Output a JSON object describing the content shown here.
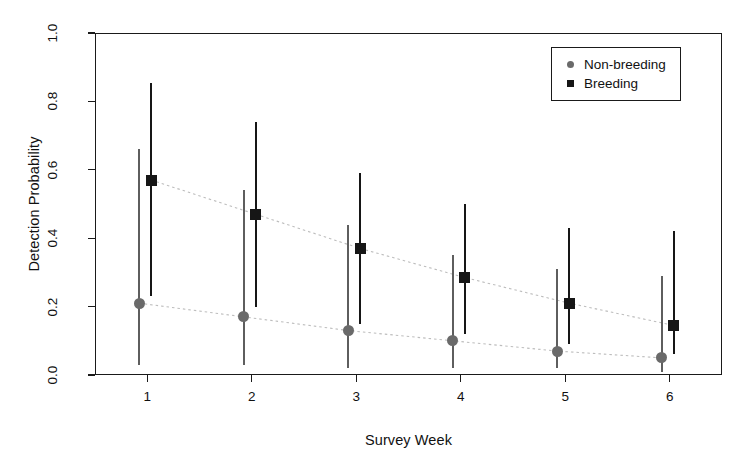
{
  "chart_data": {
    "type": "scatter",
    "title": "",
    "xlabel": "Survey Week",
    "ylabel": "Detection Probability",
    "categories": [
      "1",
      "2",
      "3",
      "4",
      "5",
      "6"
    ],
    "x": [
      1,
      2,
      3,
      4,
      5,
      6
    ],
    "xlim": [
      0.5,
      6.5
    ],
    "ylim": [
      0.0,
      1.0
    ],
    "yticks": [
      "0.0",
      "0.2",
      "0.4",
      "0.6",
      "0.8",
      "1.0"
    ],
    "ytick_values": [
      0.0,
      0.2,
      0.4,
      0.6,
      0.8,
      1.0
    ],
    "xticks": [
      "1",
      "2",
      "3",
      "4",
      "5",
      "6"
    ],
    "grid": false,
    "legend_position": "top-right",
    "series": [
      {
        "name": "Non-breeding",
        "marker": "circle",
        "color": "#6a6a6a",
        "values": [
          0.21,
          0.17,
          0.13,
          0.1,
          0.07,
          0.05
        ],
        "ci_lower": [
          0.03,
          0.03,
          0.02,
          0.02,
          0.02,
          0.01
        ],
        "ci_upper": [
          0.66,
          0.54,
          0.44,
          0.35,
          0.31,
          0.29
        ]
      },
      {
        "name": "Breeding",
        "marker": "square",
        "color": "#161616",
        "values": [
          0.57,
          0.47,
          0.37,
          0.285,
          0.21,
          0.145
        ],
        "ci_lower": [
          0.23,
          0.2,
          0.15,
          0.12,
          0.09,
          0.06
        ],
        "ci_upper": [
          0.855,
          0.74,
          0.59,
          0.5,
          0.43,
          0.42
        ]
      }
    ],
    "trend_lines": [
      {
        "series": "Non-breeding",
        "style": "dotted",
        "color": "#bdbdbd"
      },
      {
        "series": "Breeding",
        "style": "dotted",
        "color": "#bdbdbd"
      }
    ]
  },
  "legend": {
    "items": [
      {
        "label": "Non-breeding",
        "marker": "circle"
      },
      {
        "label": "Breeding",
        "marker": "square"
      }
    ]
  }
}
